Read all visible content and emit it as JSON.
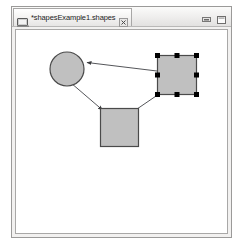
{
  "window": {
    "tab": {
      "label": "*shapesExample1.shapes",
      "icon": "shapes-diagram-file-icon",
      "close_icon": "close-icon",
      "dirty": true
    },
    "controls": [
      {
        "name": "minimize-button",
        "icon": "minimize-icon",
        "label": "Minimize"
      },
      {
        "name": "maximize-button",
        "icon": "maximize-icon",
        "label": "Maximize"
      }
    ]
  },
  "colors": {
    "shape_fill": "#c0c0c0",
    "shape_stroke": "#4a4a4a",
    "connection_stroke": "#55565a",
    "selection_handle": "#000000",
    "canvas_background": "#ffffff",
    "window_chrome": "#f2f1f0",
    "window_border": "#9b9a99"
  },
  "diagram": {
    "name": "shapes-diagram",
    "shapes": [
      {
        "id": "ellipse-1",
        "type": "ellipse",
        "label": "",
        "x": 34,
        "y": 22,
        "width": 34,
        "height": 34,
        "selected": false
      },
      {
        "id": "rectangle-1",
        "type": "rectangle",
        "label": "",
        "x": 141,
        "y": 25,
        "width": 39,
        "height": 39,
        "selected": true,
        "handles": 8
      },
      {
        "id": "rectangle-2",
        "type": "rectangle",
        "label": "",
        "x": 84,
        "y": 78,
        "width": 38,
        "height": 38,
        "selected": false
      }
    ],
    "connections": [
      {
        "id": "connection-1",
        "label": "",
        "source": "rectangle-1",
        "target": "ellipse-1",
        "arrow": "target",
        "points": [
          [
            141,
            41
          ],
          [
            69,
            32
          ]
        ]
      },
      {
        "id": "connection-2",
        "label": "",
        "source": "ellipse-1",
        "target": "rectangle-2",
        "arrow": "target",
        "points": [
          [
            57,
            55
          ],
          [
            86,
            80
          ]
        ]
      },
      {
        "id": "connection-3",
        "label": "",
        "source": "rectangle-1",
        "target": "rectangle-2",
        "arrow": "none",
        "points": [
          [
            143,
            64
          ],
          [
            120,
            79
          ]
        ]
      }
    ]
  }
}
